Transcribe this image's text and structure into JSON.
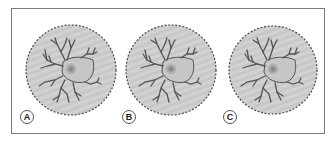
{
  "figure": {
    "panels": [
      {
        "label": "A",
        "cx": 71,
        "cy": 70,
        "r": 45,
        "label_x": 20,
        "label_y": 110
      },
      {
        "label": "B",
        "cx": 171,
        "cy": 70,
        "r": 45,
        "label_x": 122,
        "label_y": 110
      },
      {
        "label": "C",
        "cx": 273,
        "cy": 70,
        "r": 44,
        "label_x": 223,
        "label_y": 110
      }
    ],
    "colors": {
      "frame_border": "#7a7a7a",
      "disc_fill": "#d0d0d0",
      "disc_edge": "#4a4a4a",
      "cell_process": "#555555",
      "nucleus": "#8a8a8a"
    }
  }
}
